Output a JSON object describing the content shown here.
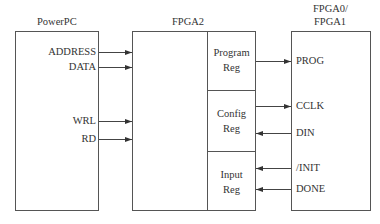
{
  "blocks": {
    "powerpc": {
      "title": "PowerPC",
      "signals": [
        "ADDRESS",
        "DATA",
        "WRL",
        "RD"
      ]
    },
    "fpga2": {
      "title": "FPGA2",
      "registers": [
        {
          "line1": "Program",
          "line2": "Reg"
        },
        {
          "line1": "Config",
          "line2": "Reg"
        },
        {
          "line1": "Input",
          "line2": "Reg"
        }
      ]
    },
    "fpga01": {
      "title_line1": "FPGA0/",
      "title_line2": "FPGA1",
      "signals": [
        "PROG",
        "CCLK",
        "DIN",
        "/INIT",
        "DONE"
      ]
    }
  },
  "connections": [
    {
      "from": "PowerPC.ADDRESS",
      "to": "FPGA2",
      "direction": "right"
    },
    {
      "from": "PowerPC.DATA",
      "to": "FPGA2",
      "direction": "right"
    },
    {
      "from": "PowerPC.WRL",
      "to": "FPGA2",
      "direction": "right"
    },
    {
      "from": "PowerPC.RD",
      "to": "FPGA2",
      "direction": "right"
    },
    {
      "from": "Program Reg",
      "to": "PROG",
      "direction": "right"
    },
    {
      "from": "Config Reg",
      "to": "CCLK",
      "direction": "right"
    },
    {
      "from": "DIN",
      "to": "Config Reg",
      "direction": "left"
    },
    {
      "from": "/INIT",
      "to": "Input Reg",
      "direction": "left"
    },
    {
      "from": "DONE",
      "to": "Input Reg",
      "direction": "left"
    }
  ],
  "colors": {
    "line": "#444444",
    "text": "#333333",
    "background": "#ffffff"
  }
}
